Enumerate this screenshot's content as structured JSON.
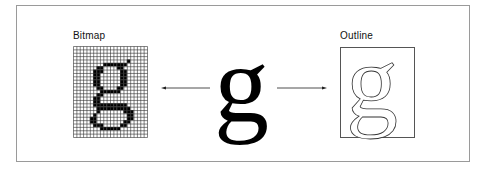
{
  "figure": {
    "bitmap_label": "Bitmap",
    "outline_label": "Outline",
    "center_glyph": "g",
    "outline_glyph": "g",
    "bitmap_grid": {
      "columns": 22,
      "rows": 27
    },
    "arrows": [
      {
        "direction": "left",
        "from": "center-glyph",
        "to": "bitmap"
      },
      {
        "direction": "right",
        "from": "center-glyph",
        "to": "outline"
      }
    ]
  }
}
